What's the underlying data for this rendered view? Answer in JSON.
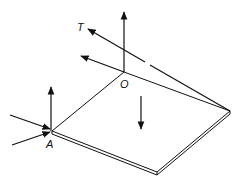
{
  "diagram": {
    "colors": {
      "stroke": "#111111",
      "background": "#ffffff"
    },
    "labels": {
      "tension": "T",
      "corner_o": "O",
      "corner_a": "A"
    },
    "elements": [
      {
        "id": "plate",
        "type": "thin rectangular plate"
      },
      {
        "id": "cable",
        "label": "T",
        "type": "cable from plate far corner through O direction"
      },
      {
        "id": "force-o-vertical",
        "type": "arrow up at O"
      },
      {
        "id": "force-o-horizontal",
        "type": "arrow left at O"
      },
      {
        "id": "force-a-vertical",
        "type": "arrow up at A"
      },
      {
        "id": "force-a-in-1",
        "type": "arrow into A"
      },
      {
        "id": "force-a-in-2",
        "type": "arrow into A"
      },
      {
        "id": "weight",
        "type": "arrow down at plate center"
      }
    ]
  }
}
